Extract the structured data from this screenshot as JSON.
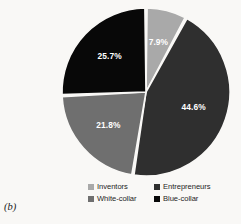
{
  "figure": {
    "panel_caption": "(b)",
    "background_color": "#f9f8f6"
  },
  "chart_data": {
    "type": "pie",
    "title": "",
    "xlabel": "",
    "ylabel": "",
    "categories": [
      "Inventors",
      "Entrepreneurs",
      "White-collar",
      "Blue-collar"
    ],
    "values": [
      7.9,
      44.6,
      21.8,
      25.7
    ],
    "value_suffix": "%",
    "data_labels": [
      "7.9%",
      "44.6%",
      "21.8%",
      "25.7%"
    ],
    "colors": [
      "#a9a9a9",
      "#2f2f2f",
      "#6f6f6f",
      "#080808"
    ],
    "label_color": "#ffffff",
    "slice_gap": true,
    "start_angle_deg": 0,
    "direction": "clockwise",
    "legend_position": "bottom",
    "grid": false
  },
  "legend": {
    "entries": [
      {
        "label": "Inventors",
        "color": "#a9a9a9"
      },
      {
        "label": "Entrepreneurs",
        "color": "#2f2f2f"
      },
      {
        "label": "White-collar",
        "color": "#6f6f6f"
      },
      {
        "label": "Blue-collar",
        "color": "#080808"
      }
    ]
  }
}
